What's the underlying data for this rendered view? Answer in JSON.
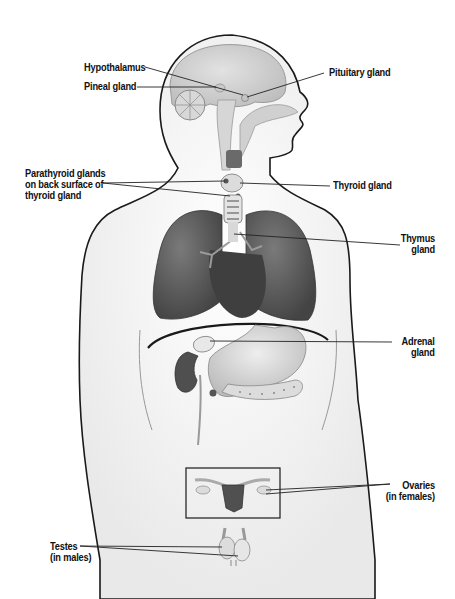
{
  "diagram": {
    "colors": {
      "outline": "#1a1a1a",
      "body_fill": "#f4f4f4",
      "brain": "#d4d4d4",
      "lungs": "#5a5a5a",
      "heart": "#4a4a4a",
      "organs_light": "#cfcfcf",
      "uterus": "#505050",
      "leader_line": "#222222"
    },
    "labels": {
      "hypothalamus": {
        "lines": [
          "Hypothalamus"
        ]
      },
      "pineal": {
        "lines": [
          "Pineal gland"
        ]
      },
      "pituitary": {
        "lines": [
          "Pituitary gland"
        ]
      },
      "parathyroid": {
        "lines": [
          "Parathyroid glands",
          "on back surface of",
          "thyroid gland"
        ]
      },
      "thyroid": {
        "lines": [
          "Thyroid gland"
        ]
      },
      "thymus": {
        "lines": [
          "Thymus",
          "gland"
        ]
      },
      "adrenal": {
        "lines": [
          "Adrenal",
          "gland"
        ]
      },
      "ovaries": {
        "lines": [
          "Ovaries",
          "(in females)"
        ]
      },
      "testes": {
        "lines": [
          "Testes",
          "(in males)"
        ]
      }
    }
  }
}
